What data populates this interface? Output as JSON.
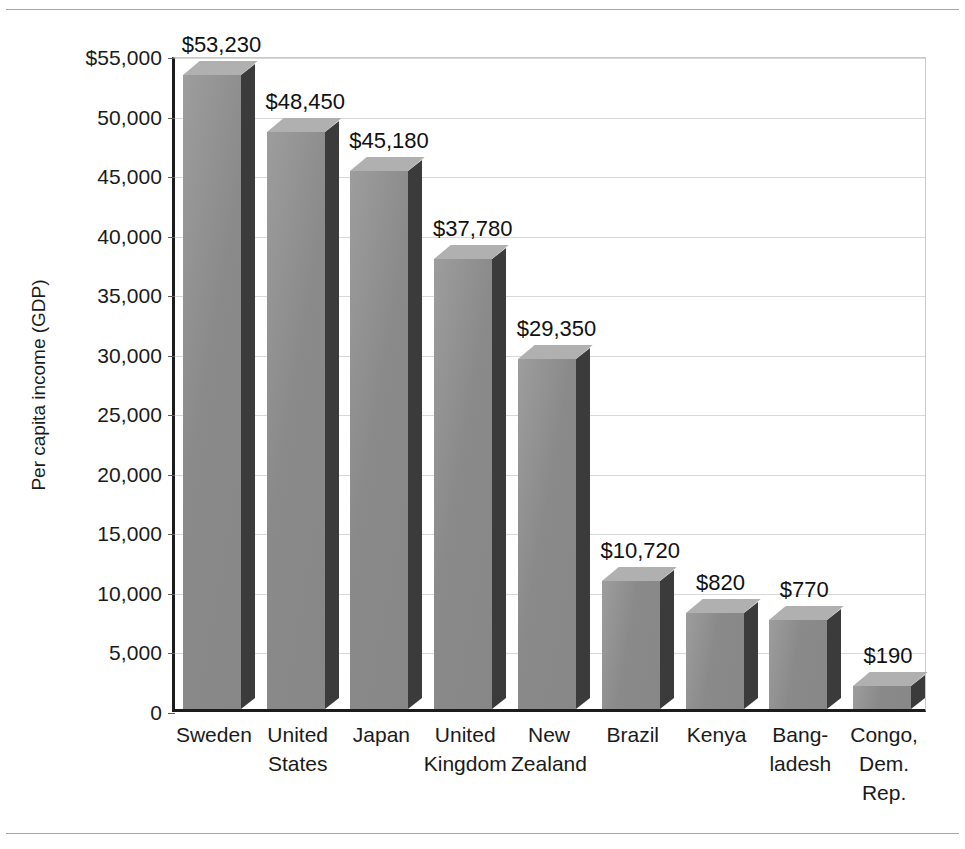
{
  "chart_data": {
    "type": "bar",
    "title": "",
    "xlabel": "",
    "ylabel": "Per capita income (GDP)",
    "ylim": [
      0,
      55000
    ],
    "grid": true,
    "legend": "none",
    "ytick_labels": [
      "$55,000",
      "50,000",
      "45,000",
      "40,000",
      "35,000",
      "30,000",
      "25,000",
      "20,000",
      "15,000",
      "10,000",
      "5,000",
      "0"
    ],
    "ytick_values": [
      55000,
      50000,
      45000,
      40000,
      35000,
      30000,
      25000,
      20000,
      15000,
      10000,
      5000,
      0
    ],
    "categories": [
      [
        "Sweden"
      ],
      [
        "United",
        "States"
      ],
      [
        "Japan"
      ],
      [
        "United",
        "Kingdom"
      ],
      [
        "New",
        "Zealand"
      ],
      [
        "Brazil"
      ],
      [
        "Kenya"
      ],
      [
        "Bang-",
        "ladesh"
      ],
      [
        "Congo,",
        "Dem.",
        "Rep."
      ]
    ],
    "category_names": [
      "Sweden",
      "United States",
      "Japan",
      "United Kingdom",
      "New Zealand",
      "Brazil",
      "Kenya",
      "Bangladesh",
      "Congo, Dem. Rep."
    ],
    "values": [
      53230,
      48450,
      45180,
      37780,
      29350,
      10720,
      820,
      770,
      190
    ],
    "data_labels": [
      "$53,230",
      "$48,450",
      "$45,180",
      "$37,780",
      "$29,350",
      "$10,720",
      "$820",
      "$770",
      "$190"
    ],
    "drawn_heights": [
      53230,
      48450,
      45180,
      37780,
      29350,
      10720,
      8050,
      7500,
      1900
    ],
    "bar_style": "3d-gray",
    "colors": {
      "bar_front": "#8a8a8a",
      "bar_top": "#b0b0b0",
      "bar_side": "#3b3b3b",
      "axis": "#1c1c1c",
      "gridline": "#d8d8d8",
      "text": "#1a1a1a",
      "rule": "#a6a6a6"
    }
  }
}
